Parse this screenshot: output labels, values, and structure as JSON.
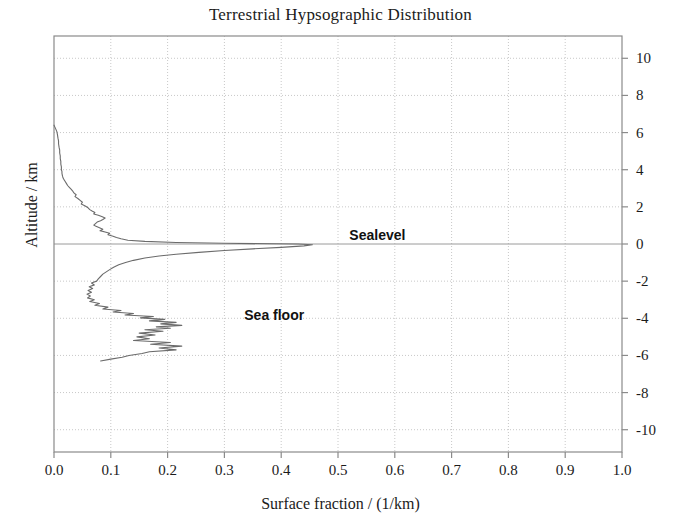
{
  "chart_data": {
    "type": "line",
    "title": "Terrestrial Hypsographic Distribution",
    "xlabel": "Surface fraction / (1/km)",
    "ylabel": "Altitude / km",
    "xlim": [
      0.0,
      1.0
    ],
    "ylim": [
      -11.2,
      11.2
    ],
    "grid": true,
    "legend_position": "none",
    "orientation": "horizontal-value-vertical-altitude",
    "xticks": [
      "0.0",
      "0.1",
      "0.2",
      "0.3",
      "0.4",
      "0.5",
      "0.6",
      "0.7",
      "0.8",
      "0.9",
      "1.0"
    ],
    "xtick_values": [
      0.0,
      0.1,
      0.2,
      0.3,
      0.4,
      0.5,
      0.6,
      0.7,
      0.8,
      0.9,
      1.0
    ],
    "yticks": [
      "10",
      "8",
      "6",
      "4",
      "2",
      "0",
      "-2",
      "-4",
      "-6",
      "-8",
      "-10"
    ],
    "ytick_values": [
      10,
      8,
      6,
      4,
      2,
      0,
      -2,
      -4,
      -6,
      -8,
      -10
    ],
    "ytick_side": "right",
    "line_color": "#6b6b6b",
    "grid_color": "#c8c8c8",
    "axis_color": "#8a8a8a",
    "annotations": [
      {
        "text": "Sealevel",
        "x": 0.52,
        "y": 0.45
      },
      {
        "text": "Sea floor",
        "x": 0.335,
        "y": -3.85
      }
    ],
    "series": [
      {
        "name": "Surface fraction",
        "altitude_km": [
          6.4,
          6.2,
          6.05,
          5.9,
          5.7,
          5.55,
          5.4,
          5.2,
          5.05,
          4.9,
          4.75,
          4.6,
          4.45,
          4.3,
          4.15,
          4.0,
          3.9,
          3.8,
          3.65,
          3.55,
          3.45,
          3.35,
          3.25,
          3.15,
          3.05,
          2.95,
          2.85,
          2.75,
          2.65,
          2.55,
          2.45,
          2.35,
          2.25,
          2.15,
          2.05,
          1.95,
          1.85,
          1.78,
          1.7,
          1.62,
          1.55,
          1.48,
          1.4,
          1.32,
          1.25,
          1.18,
          1.1,
          1.02,
          0.95,
          0.88,
          0.8,
          0.72,
          0.65,
          0.58,
          0.5,
          0.42,
          0.35,
          0.28,
          0.2,
          0.14,
          0.08,
          0.04,
          0.0,
          -0.04,
          -0.1,
          -0.18,
          -0.26,
          -0.35,
          -0.45,
          -0.55,
          -0.65,
          -0.75,
          -0.88,
          -1.0,
          -1.12,
          -1.25,
          -1.38,
          -1.5,
          -1.62,
          -1.75,
          -1.88,
          -2.0,
          -2.1,
          -2.2,
          -2.3,
          -2.4,
          -2.5,
          -2.6,
          -2.7,
          -2.8,
          -2.9,
          -3.0,
          -3.1,
          -3.2,
          -3.3,
          -3.4,
          -3.5,
          -3.58,
          -3.66,
          -3.74,
          -3.82,
          -3.9,
          -3.98,
          -4.06,
          -4.14,
          -4.22,
          -4.3,
          -4.38,
          -4.46,
          -4.54,
          -4.62,
          -4.7,
          -4.8,
          -4.9,
          -5.0,
          -5.1,
          -5.2,
          -5.3,
          -5.4,
          -5.5,
          -5.6,
          -5.7,
          -5.8,
          -5.9,
          -6.0,
          -6.1,
          -6.2,
          -6.3
        ],
        "surface_fraction": [
          0.0,
          0.003,
          0.005,
          0.006,
          0.007,
          0.008,
          0.008,
          0.009,
          0.01,
          0.01,
          0.011,
          0.011,
          0.012,
          0.012,
          0.013,
          0.013,
          0.014,
          0.014,
          0.015,
          0.016,
          0.018,
          0.02,
          0.022,
          0.024,
          0.027,
          0.03,
          0.033,
          0.035,
          0.039,
          0.037,
          0.042,
          0.046,
          0.05,
          0.048,
          0.055,
          0.06,
          0.063,
          0.067,
          0.072,
          0.07,
          0.078,
          0.084,
          0.09,
          0.086,
          0.082,
          0.076,
          0.073,
          0.07,
          0.074,
          0.08,
          0.086,
          0.081,
          0.09,
          0.098,
          0.095,
          0.104,
          0.11,
          0.118,
          0.13,
          0.16,
          0.215,
          0.3,
          0.43,
          0.455,
          0.44,
          0.4,
          0.35,
          0.3,
          0.255,
          0.215,
          0.185,
          0.16,
          0.14,
          0.126,
          0.114,
          0.105,
          0.098,
          0.092,
          0.086,
          0.082,
          0.078,
          0.075,
          0.066,
          0.071,
          0.062,
          0.068,
          0.06,
          0.066,
          0.058,
          0.064,
          0.059,
          0.071,
          0.063,
          0.08,
          0.072,
          0.095,
          0.086,
          0.118,
          0.104,
          0.14,
          0.125,
          0.175,
          0.152,
          0.195,
          0.168,
          0.215,
          0.188,
          0.225,
          0.18,
          0.205,
          0.16,
          0.192,
          0.15,
          0.178,
          0.146,
          0.168,
          0.14,
          0.205,
          0.17,
          0.225,
          0.185,
          0.215,
          0.168,
          0.155,
          0.132,
          0.12,
          0.1,
          0.082,
          0.065,
          0.05,
          0.038,
          0.028,
          0.02,
          0.014,
          0.008,
          0.004,
          0.0
        ]
      }
    ]
  }
}
